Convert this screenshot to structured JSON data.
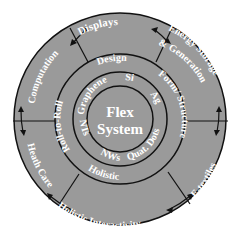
{
  "diagram": {
    "center": {
      "title_line1": "Flex",
      "title_line2": "System"
    },
    "inner_ring": {
      "labels": [
        "Graphene",
        "Si",
        "Ag",
        "Quat. Dots",
        "NWs",
        "NTs"
      ]
    },
    "middle_ring": {
      "labels": [
        "Design",
        "Form/ Structure",
        "Holistic",
        "Roll-to-Roll"
      ]
    },
    "outer_ring": {
      "labels": [
        "Displays",
        "Energy Storage",
        "& Generation",
        "E-textiles",
        "Holistic Interactivity",
        "Heath Care",
        "Computation"
      ]
    },
    "colors": {
      "fill": "#9a9a9a",
      "stroke": "#111111",
      "text": "#ffffff"
    }
  }
}
